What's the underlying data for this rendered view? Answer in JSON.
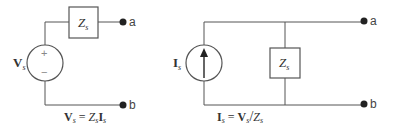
{
  "diagram": {
    "left_circuit": {
      "name": "voltage-source-circuit",
      "source": {
        "type": "voltage-source",
        "label_main": "V",
        "label_sub": "s",
        "plus": "+",
        "minus": "−"
      },
      "impedance": {
        "label_main": "Z",
        "label_sub": "s",
        "connection": "series"
      },
      "terminals": {
        "top": "a",
        "bottom": "b"
      },
      "equation": {
        "lhs_main": "V",
        "lhs_sub": "s",
        "eq": " = ",
        "r1_main": "Z",
        "r1_sub": "s",
        "r2_main": "I",
        "r2_sub": "s"
      }
    },
    "right_circuit": {
      "name": "current-source-circuit",
      "source": {
        "type": "current-source",
        "label_main": "I",
        "label_sub": "s",
        "arrow": "up"
      },
      "impedance": {
        "label_main": "Z",
        "label_sub": "s",
        "connection": "parallel"
      },
      "terminals": {
        "top": "a",
        "bottom": "b"
      },
      "equation": {
        "lhs_main": "I",
        "lhs_sub": "s",
        "eq": " = ",
        "r1_main": "V",
        "r1_sub": "s",
        "div": "/",
        "r2_main": "Z",
        "r2_sub": "s"
      }
    },
    "colors": {
      "wire": "#555555",
      "terminal": "#222222",
      "text": "#333333"
    }
  }
}
